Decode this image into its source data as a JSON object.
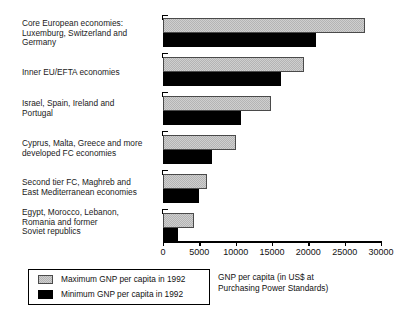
{
  "chart_data": {
    "type": "bar",
    "orientation": "horizontal",
    "title": "",
    "xlabel": "GNP per  capita (in US$ at\nPurchasing Power Standards)",
    "ylabel": "",
    "xlim": [
      0,
      30000
    ],
    "grid": false,
    "legend_position": "bottom-left",
    "xticks": [
      0,
      5000,
      10000,
      15000,
      20000,
      25000,
      30000
    ],
    "xtick_labels": [
      "0",
      "5000",
      "10000",
      "15000",
      "20000",
      "25000",
      "30000"
    ],
    "categories": [
      "Core European economies:\nLuxemburg, Switzerland and\nGermany",
      "Inner EU/EFTA economies",
      "Israel, Spain, Ireland and\nPortugal",
      "Cyprus, Malta, Greece and more\ndeveloped FC economies",
      "Second tier FC, Maghreb and\nEast Mediterranean economies",
      "Egypt, Morocco, Lebanon,\nRomania and former\nSoviet republics"
    ],
    "series": [
      {
        "name": "Maximum GNP per capita in 1992",
        "color": "#cfcfcf",
        "values": [
          27800,
          19400,
          14900,
          10100,
          6100,
          4200
        ]
      },
      {
        "name": "Minimum GNP per capita in 1992",
        "color": "#000000",
        "values": [
          21000,
          16300,
          10800,
          6700,
          5000,
          2100
        ]
      }
    ]
  },
  "legend": {
    "max_label": "Maximum GNP per capita in 1992",
    "min_label": "Minimum GNP per capita in 1992"
  },
  "axis_title": "GNP per  capita (in US$ at\nPurchasing Power Standards)"
}
